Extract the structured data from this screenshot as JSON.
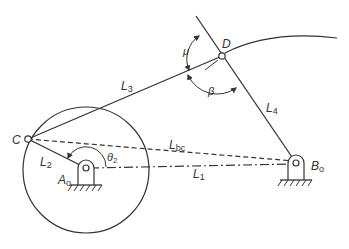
{
  "diagram": {
    "type": "four-bar linkage",
    "colors": {
      "stroke": "#333333",
      "background": "#ffffff"
    },
    "points": {
      "C": {
        "label": "C",
        "x": 28,
        "y": 139
      },
      "D": {
        "label": "D",
        "x": 222,
        "y": 56
      },
      "A0": {
        "label": "A",
        "sub": "o",
        "x": 86,
        "y": 168
      },
      "B0": {
        "label": "B",
        "sub": "o",
        "x": 296,
        "y": 163
      }
    },
    "links": {
      "L1": {
        "label": "L",
        "sub": "1",
        "style": "dash-dot"
      },
      "L2": {
        "label": "L",
        "sub": "2",
        "style": "solid"
      },
      "L3": {
        "label": "L",
        "sub": "3",
        "style": "solid"
      },
      "L4": {
        "label": "L",
        "sub": "4",
        "style": "solid"
      },
      "Lbc": {
        "label": "L",
        "sub": "bc",
        "style": "dashed"
      }
    },
    "angles": {
      "theta2": {
        "label": "θ",
        "sub": "2"
      },
      "mu": {
        "label": "μ"
      },
      "beta": {
        "label": "β"
      }
    },
    "crank_circle": {
      "cx": 86,
      "cy": 168,
      "r": 63
    }
  }
}
